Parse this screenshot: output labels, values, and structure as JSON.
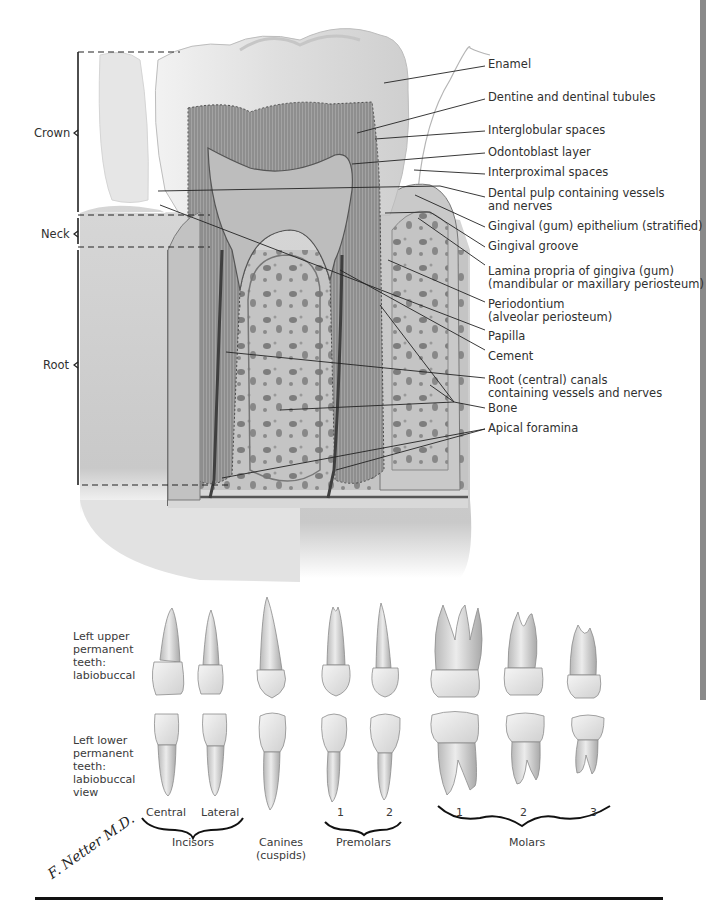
{
  "figure": {
    "regions": [
      {
        "id": "crown",
        "label": "Crown"
      },
      {
        "id": "neck",
        "label": "Neck"
      },
      {
        "id": "root",
        "label": "Root"
      }
    ],
    "labels": [
      {
        "id": "enamel",
        "text": "Enamel"
      },
      {
        "id": "dentine",
        "text": "Dentine and dentinal tubules"
      },
      {
        "id": "interglobular",
        "text": "Interglobular spaces"
      },
      {
        "id": "odontoblast",
        "text": "Odontoblast layer"
      },
      {
        "id": "interproximal",
        "text": "Interproximal spaces"
      },
      {
        "id": "pulp",
        "text": "Dental pulp containing vessels\nand nerves"
      },
      {
        "id": "gingival-epithelium",
        "text": "Gingival (gum) epithelium (stratified)"
      },
      {
        "id": "gingival-groove",
        "text": "Gingival groove"
      },
      {
        "id": "lamina-propria",
        "text": "Lamina propria of gingiva (gum)\n(mandibular or maxillary periosteum)"
      },
      {
        "id": "periodontium",
        "text": "Periodontium\n(alveolar periosteum)"
      },
      {
        "id": "papilla",
        "text": "Papilla"
      },
      {
        "id": "cement",
        "text": "Cement"
      },
      {
        "id": "root-canals",
        "text": "Root (central) canals\ncontaining vessels and nerves"
      },
      {
        "id": "bone",
        "text": "Bone"
      },
      {
        "id": "apical-foramina",
        "text": "Apical foramina"
      }
    ]
  },
  "teeth_panel": {
    "upper_row_label": "Left upper\npermanent\nteeth:\nlabiobuccal",
    "lower_row_label": "Left lower\npermanent\nteeth:\nlabiobuccal\nview",
    "tooth_numbers": {
      "incisors": [
        "Central",
        "Lateral"
      ],
      "premolars": [
        "1",
        "2"
      ],
      "molars": [
        "1",
        "2",
        "3"
      ]
    },
    "groups": [
      {
        "id": "incisors",
        "label": "Incisors"
      },
      {
        "id": "canines",
        "label": "Canines\n(cuspids)"
      },
      {
        "id": "premolars",
        "label": "Premolars"
      },
      {
        "id": "molars",
        "label": "Molars"
      }
    ]
  },
  "signature": "F. Netter M.D.",
  "colors": {
    "ink": "#303030",
    "enamel": "#e4e4e4",
    "dentine": "#9a9a9a",
    "pulp": "#b8b8b8",
    "bone": "#bdbdbd",
    "gum": "#d2d2d2",
    "rule": "#111111"
  }
}
